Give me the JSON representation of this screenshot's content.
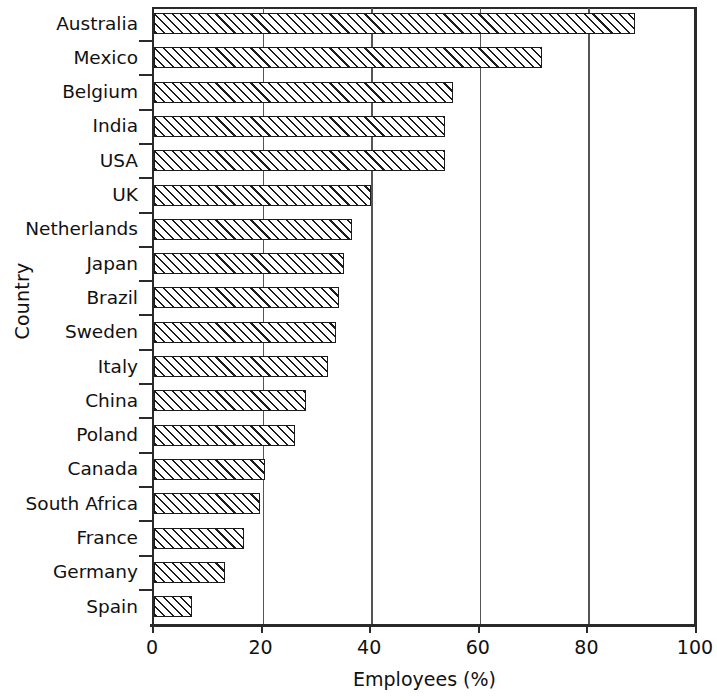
{
  "chart_data": {
    "type": "bar",
    "orientation": "horizontal",
    "title": "",
    "xlabel": "Employees (%)",
    "ylabel": "Country",
    "xlim": [
      0,
      100
    ],
    "xticks": [
      0,
      20,
      40,
      60,
      80,
      100
    ],
    "grid": "vertical gridlines at x ticks",
    "legend": "none",
    "bar_style": "white fill with black diagonal hatch, black outline",
    "categories": [
      "Australia",
      "Mexico",
      "Belgium",
      "India",
      "USA",
      "UK",
      "Netherlands",
      "Japan",
      "Brazil",
      "Sweden",
      "Italy",
      "China",
      "Poland",
      "Canada",
      "South Africa",
      "France",
      "Germany",
      "Spain"
    ],
    "values": [
      88.5,
      71.5,
      55,
      53.5,
      53.5,
      40,
      36.5,
      35,
      34,
      33.5,
      32,
      28,
      26,
      20.5,
      19.5,
      16.5,
      13,
      7
    ]
  },
  "axis": {
    "x_tick_labels": [
      "0",
      "20",
      "40",
      "60",
      "80",
      "100"
    ],
    "x_title": "Employees (%)",
    "y_title": "Country"
  }
}
